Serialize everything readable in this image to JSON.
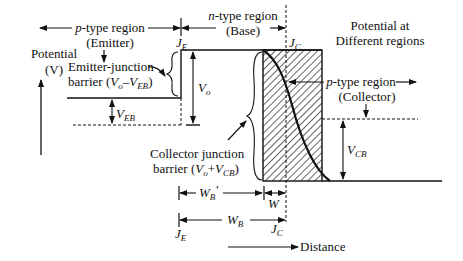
{
  "diagram": {
    "title": "Potential at Different regions",
    "title_line1": "Potential at",
    "title_line2": "Different regions",
    "y_axis": {
      "line1": "Potential",
      "line2": "(V)"
    },
    "x_axis": {
      "label": "Distance"
    },
    "regions": {
      "emitter": {
        "line1": "p-type region",
        "p": "p",
        "rest": "-type region",
        "line2": "(Emitter)"
      },
      "base": {
        "n": "n",
        "rest": "-type region",
        "line2": "(Base)"
      },
      "collector": {
        "p": "p",
        "rest": "-type region",
        "line2": "(Collector)"
      }
    },
    "junctions": {
      "emitter": {
        "main": "J",
        "sub": "E"
      },
      "collector": {
        "main": "J",
        "sub": "C"
      }
    },
    "barriers": {
      "emitter": {
        "line1": "Emitter-junction",
        "line2_prefix": "barrier (",
        "v": "V",
        "o": "o",
        "minus": "–",
        "v2": "V",
        "sub2": "EB",
        "close": ")"
      },
      "collector": {
        "line1": "Collector junction",
        "line2_prefix": "barrier (",
        "v": "V",
        "o": "o",
        "plus": "+",
        "v2": "V",
        "sub2": "CB",
        "close": ")"
      }
    },
    "voltages": {
      "vo": {
        "main": "V",
        "sub": "o"
      },
      "veb": {
        "main": "V",
        "sub": "EB"
      },
      "vcb": {
        "main": "V",
        "sub": "CB"
      }
    },
    "widths": {
      "wb_prime": {
        "main": "W",
        "sub": "B",
        "prime": "'"
      },
      "w": {
        "main": "W"
      },
      "wb": {
        "main": "W",
        "sub": "B"
      }
    },
    "colors": {
      "stroke": "#111111",
      "background": "#ffffff"
    }
  }
}
